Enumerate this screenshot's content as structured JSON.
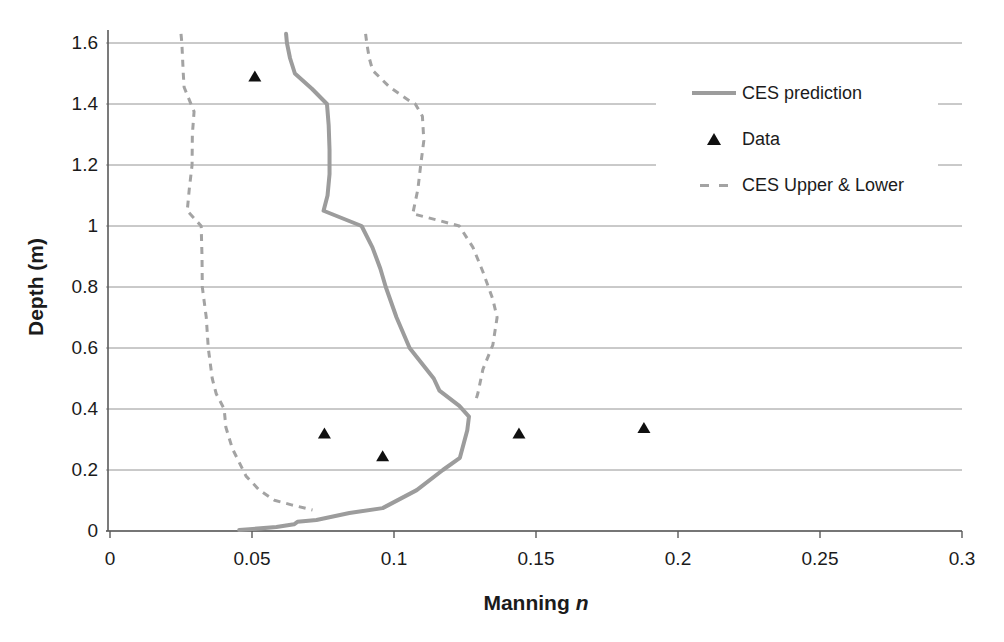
{
  "chart_data": {
    "type": "line",
    "title": "",
    "xlabel": "Manning n",
    "xlabel_parts": {
      "main": "Manning",
      "italic": "n"
    },
    "ylabel": "Depth (m)",
    "xlim": [
      0,
      0.3
    ],
    "ylim": [
      0,
      1.6
    ],
    "x_ticks": [
      0,
      0.05,
      0.1,
      0.15,
      0.2,
      0.25,
      0.3
    ],
    "x_tick_labels": [
      "0",
      "0.05",
      "0.1",
      "0.15",
      "0.2",
      "0.25",
      "0.3"
    ],
    "y_ticks": [
      0,
      0.2,
      0.4,
      0.6,
      0.8,
      1.0,
      1.2,
      1.4,
      1.6
    ],
    "y_tick_labels": [
      "0",
      "0.2",
      "0.4",
      "0.6",
      "0.8",
      "1",
      "1.2",
      "1.4",
      "1.6"
    ],
    "grid": "horizontal",
    "grid_color": "#949494",
    "axis_color": "#5a5a5a",
    "legend_position": "upper right",
    "series": [
      {
        "name": "CES prediction",
        "style": "solid",
        "color": "#9c9c9c",
        "width": 4,
        "points": [
          [
            0.062,
            1.63
          ],
          [
            0.0623,
            1.6
          ],
          [
            0.0634,
            1.55
          ],
          [
            0.0651,
            1.5
          ],
          [
            0.0711,
            1.45
          ],
          [
            0.0764,
            1.4
          ],
          [
            0.077,
            1.33
          ],
          [
            0.0773,
            1.25
          ],
          [
            0.0773,
            1.17
          ],
          [
            0.0766,
            1.1
          ],
          [
            0.0752,
            1.05
          ],
          [
            0.0886,
            1.0
          ],
          [
            0.0924,
            0.93
          ],
          [
            0.0952,
            0.86
          ],
          [
            0.0971,
            0.8
          ],
          [
            0.1009,
            0.7
          ],
          [
            0.1055,
            0.6
          ],
          [
            0.114,
            0.5
          ],
          [
            0.116,
            0.46
          ],
          [
            0.123,
            0.41
          ],
          [
            0.1264,
            0.375
          ],
          [
            0.1258,
            0.33
          ],
          [
            0.1232,
            0.24
          ],
          [
            0.1172,
            0.2
          ],
          [
            0.108,
            0.134
          ],
          [
            0.096,
            0.075
          ],
          [
            0.0843,
            0.059
          ],
          [
            0.0727,
            0.036
          ],
          [
            0.0689,
            0.033
          ],
          [
            0.066,
            0.03
          ],
          [
            0.0648,
            0.022
          ],
          [
            0.0586,
            0.013
          ],
          [
            0.0455,
            0.003
          ]
        ]
      },
      {
        "name": "Data",
        "style": "markers-triangle",
        "color": "#101010",
        "points": [
          [
            0.051,
            1.49
          ],
          [
            0.0755,
            0.32
          ],
          [
            0.096,
            0.245
          ],
          [
            0.144,
            0.32
          ],
          [
            0.188,
            0.338
          ]
        ]
      },
      {
        "name": "CES Upper",
        "style": "dashed",
        "color": "#a3a3a3",
        "width": 3,
        "points": [
          [
            0.09,
            1.63
          ],
          [
            0.0904,
            1.6
          ],
          [
            0.0913,
            1.55
          ],
          [
            0.0925,
            1.51
          ],
          [
            0.0985,
            1.455
          ],
          [
            0.1055,
            1.41
          ],
          [
            0.1075,
            1.4
          ],
          [
            0.11,
            1.36
          ],
          [
            0.1105,
            1.28
          ],
          [
            0.1094,
            1.2
          ],
          [
            0.1084,
            1.12
          ],
          [
            0.1066,
            1.04
          ],
          [
            0.115,
            1.02
          ],
          [
            0.123,
            1.0
          ],
          [
            0.1278,
            0.93
          ],
          [
            0.1313,
            0.85
          ],
          [
            0.1348,
            0.76
          ],
          [
            0.1363,
            0.7
          ],
          [
            0.1348,
            0.61
          ],
          [
            0.1313,
            0.53
          ],
          [
            0.1295,
            0.45
          ],
          [
            0.1285,
            0.42
          ]
        ]
      },
      {
        "name": "CES Lower",
        "style": "dashed",
        "color": "#a3a3a3",
        "width": 3,
        "points": [
          [
            0.025,
            1.63
          ],
          [
            0.0253,
            1.6
          ],
          [
            0.0258,
            1.5
          ],
          [
            0.0261,
            1.455
          ],
          [
            0.0296,
            1.375
          ],
          [
            0.029,
            1.3
          ],
          [
            0.0289,
            1.2
          ],
          [
            0.0279,
            1.12
          ],
          [
            0.0272,
            1.05
          ],
          [
            0.0321,
            1.0
          ],
          [
            0.0324,
            0.9
          ],
          [
            0.0325,
            0.8
          ],
          [
            0.0339,
            0.7
          ],
          [
            0.0346,
            0.6
          ],
          [
            0.036,
            0.5
          ],
          [
            0.0374,
            0.45
          ],
          [
            0.0402,
            0.4
          ],
          [
            0.0408,
            0.34
          ],
          [
            0.0431,
            0.27
          ],
          [
            0.0479,
            0.18
          ],
          [
            0.0526,
            0.134
          ],
          [
            0.0579,
            0.101
          ],
          [
            0.0642,
            0.085
          ],
          [
            0.0713,
            0.069
          ]
        ]
      }
    ],
    "legend": [
      {
        "label": "CES prediction",
        "swatch": "solid-line",
        "color": "#9c9c9c"
      },
      {
        "label": "Data",
        "swatch": "triangle",
        "color": "#101010"
      },
      {
        "label": "CES Upper & Lower",
        "swatch": "dashed-line",
        "color": "#a3a3a3"
      }
    ]
  }
}
